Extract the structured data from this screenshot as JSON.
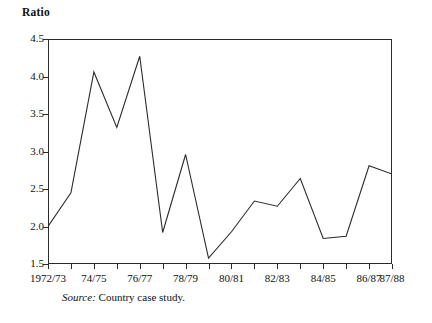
{
  "chart_data": {
    "type": "line",
    "title": "",
    "ylabel": "Ratio",
    "xlabel": "",
    "ylim": [
      1.5,
      4.5
    ],
    "ytick_values": [
      1.5,
      2.0,
      2.5,
      3.0,
      3.5,
      4.0,
      4.5
    ],
    "ytick_labels": [
      "1.5",
      "2.0",
      "2.5",
      "3.0",
      "3.5",
      "4.0",
      "4.5"
    ],
    "grid": false,
    "legend": false,
    "categories": [
      "1972/73",
      "73/74",
      "74/75",
      "75/76",
      "76/77",
      "77/78",
      "78/79",
      "79/80",
      "80/81",
      "81/82",
      "82/83",
      "83/84",
      "84/85",
      "85/86",
      "86/87",
      "87/88"
    ],
    "xtick_labels_shown": [
      "1972/73",
      "",
      "74/75",
      "",
      "76/77",
      "",
      "78/79",
      "",
      "80/81",
      "",
      "82/83",
      "",
      "84/85",
      "",
      "86/87",
      "87/88"
    ],
    "values": [
      2.0,
      2.45,
      4.06,
      3.32,
      4.27,
      1.92,
      2.96,
      1.58,
      1.93,
      2.34,
      2.27,
      2.64,
      1.84,
      1.87,
      2.81,
      2.7
    ],
    "series": [
      {
        "name": "Ratio",
        "color": "#2b2b2b",
        "values": [
          2.0,
          2.45,
          4.06,
          3.32,
          4.27,
          1.92,
          2.96,
          1.58,
          1.93,
          2.34,
          2.27,
          2.64,
          1.84,
          1.87,
          2.81,
          2.7
        ]
      }
    ],
    "annotations": []
  },
  "figure": {
    "axis_title": "Ratio",
    "source_label": "Source:",
    "source_text": "Country case study.",
    "line_color": "#2b2b2b",
    "frame_color": "#2b2b2b",
    "background": "#ffffff"
  }
}
